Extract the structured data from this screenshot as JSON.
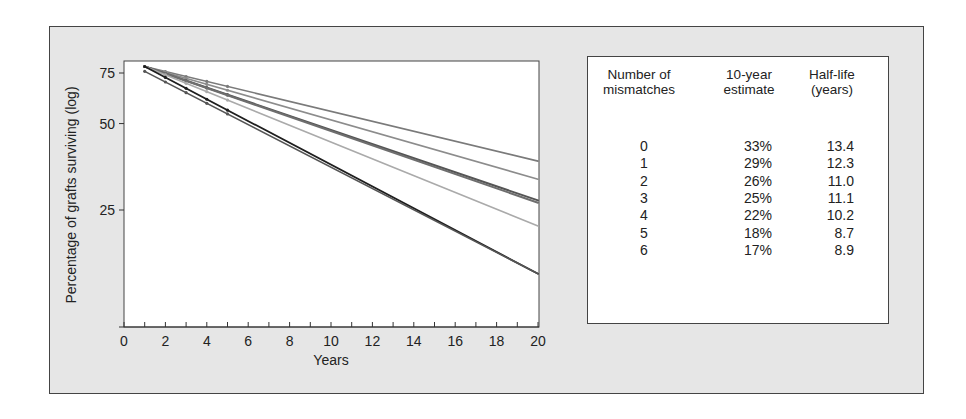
{
  "chart_data": {
    "type": "line",
    "title": "",
    "xlabel": "Years",
    "ylabel": "Percentage of grafts surviving (log)",
    "xlim": [
      0,
      20
    ],
    "x_ticks": [
      0,
      2,
      4,
      6,
      8,
      10,
      12,
      14,
      16,
      18,
      20
    ],
    "y_ticks": [
      25,
      50,
      75
    ],
    "y_scale": "log",
    "grid": false,
    "legend_position": "none",
    "series": [
      {
        "name": "0 mismatches",
        "color": "#7a7a7a",
        "width": 1.6,
        "x": [
          1,
          20
        ],
        "values": [
          79,
          37
        ]
      },
      {
        "name": "1 mismatch",
        "color": "#8c8c8c",
        "width": 1.6,
        "x": [
          1,
          20
        ],
        "values": [
          79,
          32
        ]
      },
      {
        "name": "2 mismatches",
        "color": "#555555",
        "width": 2.0,
        "x": [
          1,
          20
        ],
        "values": [
          79,
          27
        ]
      },
      {
        "name": "3 mismatches",
        "color": "#6e6e6e",
        "width": 2.0,
        "x": [
          1,
          20
        ],
        "values": [
          79,
          26.5
        ]
      },
      {
        "name": "4 mismatches",
        "color": "#aaaaaa",
        "width": 1.6,
        "x": [
          1,
          20
        ],
        "values": [
          79,
          22
        ]
      },
      {
        "name": "5 mismatches",
        "color": "#1e1e1e",
        "width": 1.8,
        "x": [
          1,
          20
        ],
        "values": [
          79,
          15
        ]
      },
      {
        "name": "6 mismatches",
        "color": "#555555",
        "width": 1.6,
        "x": [
          1,
          20
        ],
        "values": [
          76,
          15
        ]
      }
    ]
  },
  "table": {
    "headers": [
      {
        "line1": "Number of",
        "line2": "mismatches"
      },
      {
        "line1": "10-year",
        "line2": "estimate"
      },
      {
        "line1": "Half-life",
        "line2": "(years)"
      }
    ],
    "rows": [
      {
        "mismatches": "0",
        "estimate": "33%",
        "half_life": "13.4"
      },
      {
        "mismatches": "1",
        "estimate": "29%",
        "half_life": "12.3"
      },
      {
        "mismatches": "2",
        "estimate": "26%",
        "half_life": "11.0"
      },
      {
        "mismatches": "3",
        "estimate": "25%",
        "half_life": "11.1"
      },
      {
        "mismatches": "4",
        "estimate": "22%",
        "half_life": "10.2"
      },
      {
        "mismatches": "5",
        "estimate": "18%",
        "half_life": "8.7"
      },
      {
        "mismatches": "6",
        "estimate": "17%",
        "half_life": "8.9"
      }
    ]
  },
  "colors": {
    "panel_background": "#e6e6e6",
    "plot_background": "#ffffff",
    "border": "#444444"
  }
}
